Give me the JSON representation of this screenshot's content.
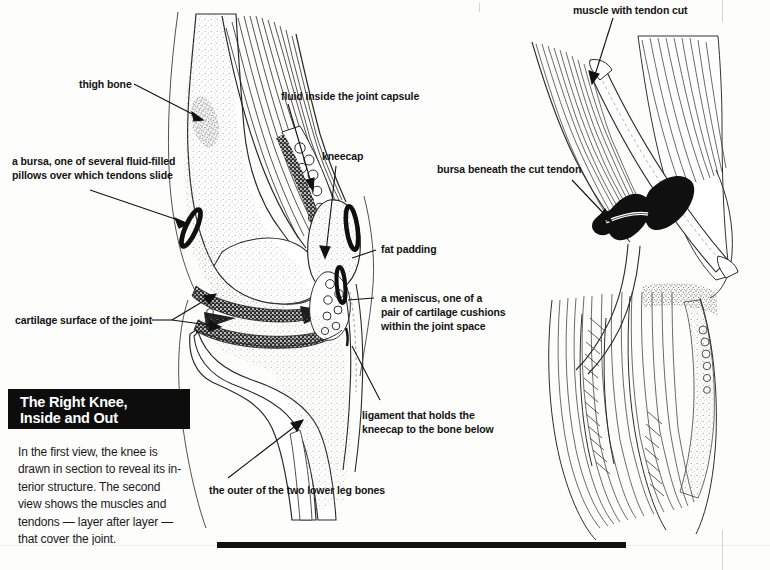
{
  "title": {
    "line1": "The Right Knee,",
    "line2": "Inside and Out"
  },
  "caption": {
    "line1": "In the first view, the knee is",
    "line2": "drawn in section to reveal its in-",
    "line3": "terior structure. The second",
    "line4": "view shows the muscles and",
    "line5": "tendons — layer after layer —",
    "line6": "that cover the joint."
  },
  "left_figure": {
    "name": "knee-sectional-view",
    "labels": {
      "thigh_bone": "thigh bone",
      "bursa_line1": "a bursa, one of several fluid-filled",
      "bursa_line2": "pillows over which tendons slide",
      "cartilage": "cartilage surface of the joint",
      "fluid": "fluid inside the joint capsule",
      "kneecap": "kneecap",
      "fat_padding": "fat padding",
      "meniscus_line1": "a meniscus, one of a",
      "meniscus_line2": "pair of cartilage cushions",
      "meniscus_line3": "within the joint space",
      "ligament_line1": "ligament that holds the",
      "ligament_line2": "kneecap to the bone below",
      "lower_leg_bone": "the outer of the two lower leg bones"
    }
  },
  "right_figure": {
    "name": "knee-muscle-view",
    "labels": {
      "muscle_tendon_cut": "muscle with tendon cut",
      "bursa_cut_tendon": "bursa beneath the cut tendon"
    }
  },
  "colors": {
    "ink": "#141414",
    "paper": "#fdfdfc",
    "title_bg": "#0d0d0d",
    "title_fg": "#ffffff",
    "rule": "#111111"
  }
}
